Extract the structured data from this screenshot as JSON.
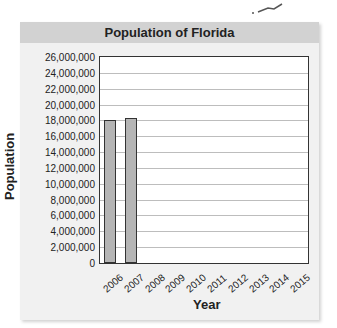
{
  "chart_data": {
    "type": "bar",
    "title": "Population of Florida",
    "xlabel": "Year",
    "ylabel": "Population",
    "categories": [
      "2006",
      "2007",
      "2008",
      "2009",
      "2010",
      "2011",
      "2012",
      "2013",
      "2014",
      "2015"
    ],
    "values": [
      18000000,
      18300000,
      null,
      null,
      null,
      null,
      null,
      null,
      null,
      null
    ],
    "ylim": [
      0,
      26000000
    ],
    "yticks": [
      "0",
      "2,000,000",
      "4,000,000",
      "6,000,000",
      "8,000,000",
      "10,000,000",
      "12,000,000",
      "14,000,000",
      "16,000,000",
      "18,000,000",
      "20,000,000",
      "22,000,000",
      "24,000,000",
      "26,000,000"
    ],
    "grid": true,
    "colors": {
      "bar": "#b5b5b5",
      "title_bg": "#d2d2d2",
      "panel_bg": "#f1f1f1"
    }
  }
}
